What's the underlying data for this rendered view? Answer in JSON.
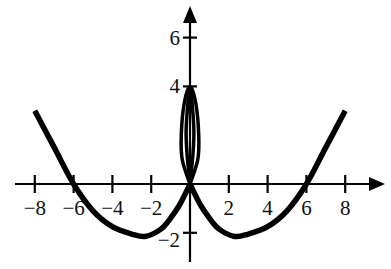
{
  "chart_data": {
    "type": "line",
    "title": "",
    "xlabel": "",
    "ylabel": "",
    "xlim": [
      -9,
      9.5
    ],
    "ylim": [
      -3,
      7
    ],
    "grid": false,
    "legend": null,
    "x_ticks": [
      -8,
      -6,
      -4,
      -2,
      2,
      4,
      6,
      8
    ],
    "x_tick_labels": [
      "−8",
      "−6",
      "−4",
      "−2",
      "2",
      "4",
      "6",
      "8"
    ],
    "y_ticks": [
      6,
      4,
      -2
    ],
    "y_tick_labels": [
      "6",
      "4",
      "−2"
    ],
    "series": [
      {
        "name": "left-branch",
        "x": [
          -8,
          -7,
          -6,
          -5,
          -4,
          -3,
          -2.3,
          -1.5,
          -1,
          -0.5,
          0
        ],
        "y": [
          3,
          1.5,
          0,
          -1.1,
          -1.75,
          -2.05,
          -2.15,
          -1.85,
          -1.4,
          -0.8,
          0
        ]
      },
      {
        "name": "right-branch",
        "x": [
          0,
          0.5,
          1,
          1.5,
          2.3,
          3,
          4,
          5,
          6,
          7,
          8
        ],
        "y": [
          0,
          -0.8,
          -1.4,
          -1.85,
          -2.15,
          -2.05,
          -1.75,
          -1.1,
          0,
          1.5,
          3
        ]
      },
      {
        "name": "central-loop-outer",
        "x": [
          0,
          -0.4,
          -0.45,
          -0.3,
          0,
          0.3,
          0.45,
          0.4,
          0
        ],
        "y": [
          0,
          1,
          2,
          3.3,
          4,
          3.3,
          2,
          1,
          0
        ]
      },
      {
        "name": "central-loop-inner",
        "x": [
          0,
          -0.15,
          -0.2,
          -0.1,
          0,
          0.1,
          0.2,
          0.15,
          0
        ],
        "y": [
          0,
          1.2,
          2.2,
          3.4,
          4,
          3.4,
          2.2,
          1.2,
          0
        ]
      }
    ],
    "annotations": []
  },
  "axes": {
    "x_axis_label": "",
    "y_axis_label": ""
  },
  "colors": {
    "curve": "#000000",
    "axis": "#000000",
    "background": "#ffffff"
  }
}
